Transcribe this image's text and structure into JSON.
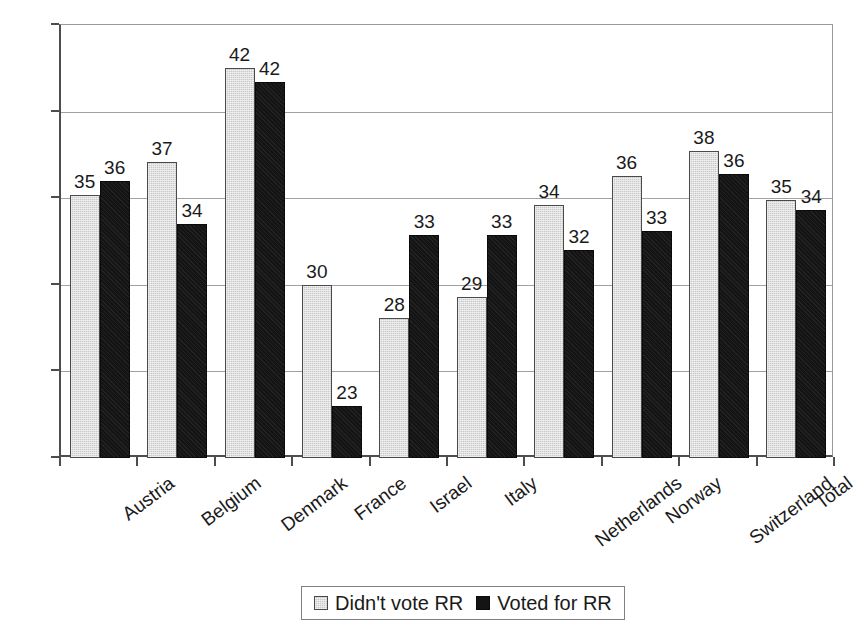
{
  "chart_data": {
    "type": "bar",
    "title": "",
    "subtitle": "",
    "xlabel": "",
    "ylabel": "",
    "ylim": [
      20,
      45
    ],
    "ytick_step": 5,
    "yticks": [
      "20",
      "25",
      "30",
      "35",
      "40",
      "45"
    ],
    "grid": true,
    "legend_position": "bottom-center",
    "categories": [
      "Austria",
      "Belgium",
      "Denmark",
      "France",
      "Israel",
      "Italy",
      "Netherlands",
      "Norway",
      "Switzerland",
      "Total"
    ],
    "series": [
      {
        "name": "Didn't vote RR",
        "color": "#c9c9c9",
        "values": [
          35.2,
          37.1,
          42.5,
          30.0,
          28.1,
          29.3,
          34.6,
          36.3,
          37.7,
          34.9
        ],
        "labels": [
          "35",
          "37",
          "42",
          "30",
          "28",
          "29",
          "34",
          "36",
          "38",
          "35"
        ]
      },
      {
        "name": "Voted for RR",
        "color": "#141414",
        "values": [
          36.0,
          33.5,
          41.7,
          23.0,
          32.9,
          32.9,
          32.0,
          33.1,
          36.4,
          34.3
        ],
        "labels": [
          "36",
          "34",
          "42",
          "23",
          "33",
          "33",
          "32",
          "33",
          "36",
          "34"
        ]
      }
    ]
  },
  "legend": {
    "entries": [
      {
        "label": "Didn't vote RR",
        "swatch": "series-a"
      },
      {
        "label": "Voted for RR",
        "swatch": "series-b"
      }
    ]
  }
}
